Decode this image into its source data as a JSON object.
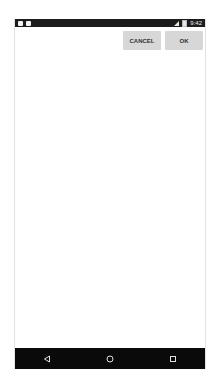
{
  "status_bar": {
    "time": "9:42",
    "left_icons": [
      "notification-icon",
      "notification-icon"
    ],
    "right_icons": [
      "signal-icon",
      "battery-icon"
    ]
  },
  "dialog": {
    "cancel_label": "CANCEL",
    "ok_label": "OK"
  },
  "nav_bar": {
    "buttons": [
      "back-icon",
      "home-icon",
      "recents-icon"
    ]
  },
  "colors": {
    "status_bar_bg": "#1c1c1c",
    "nav_bar_bg": "#0a0a0a",
    "button_bg": "#d7d7d7",
    "content_bg": "#ffffff"
  }
}
